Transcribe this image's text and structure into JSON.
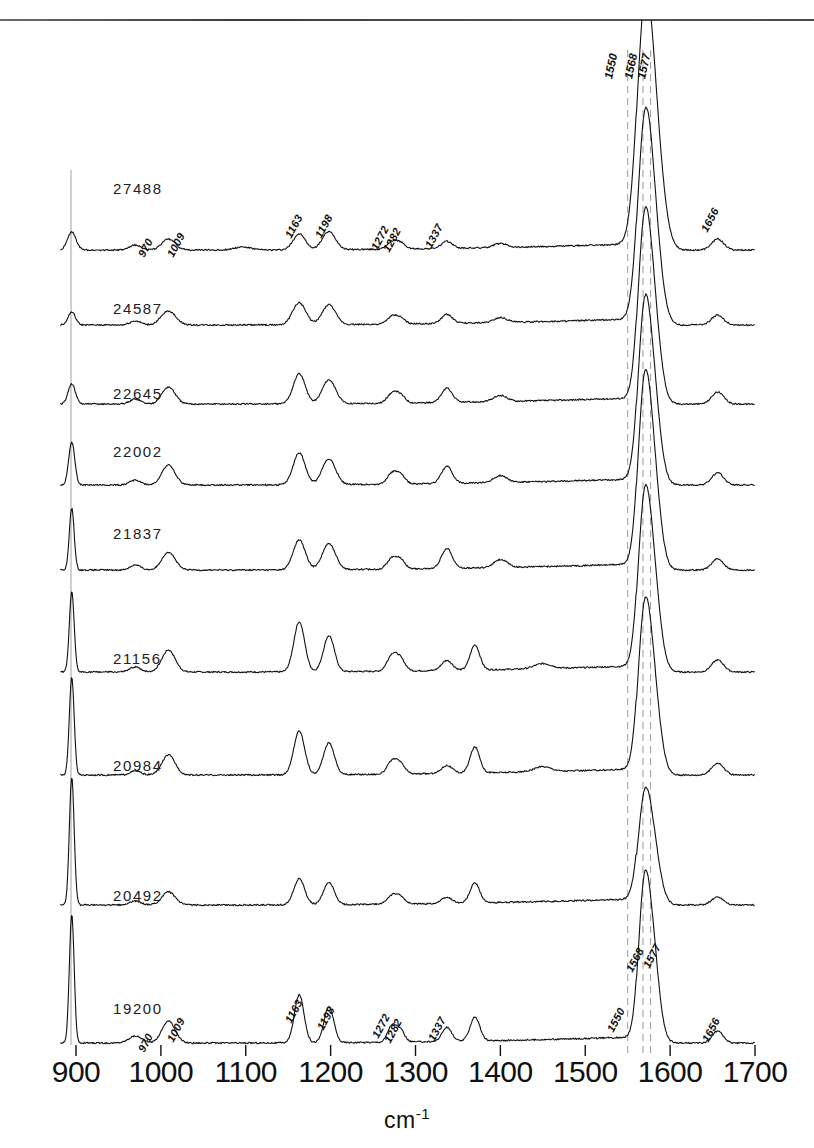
{
  "figure": {
    "ylabel": "Relative Intensity",
    "xlabel_text": "cm",
    "xlabel_sup": "-1"
  },
  "axis": {
    "ticks": [
      {
        "value": 900,
        "label": "900"
      },
      {
        "value": 1000,
        "label": "1000"
      },
      {
        "value": 1100,
        "label": "1100"
      },
      {
        "value": 1200,
        "label": "1200"
      },
      {
        "value": 1300,
        "label": "1300"
      },
      {
        "value": 1400,
        "label": "1400"
      },
      {
        "value": 1500,
        "label": "1500"
      },
      {
        "value": 1600,
        "label": "1600"
      },
      {
        "value": 1700,
        "label": "1700"
      }
    ]
  },
  "reference_lines": [
    {
      "value": 1550,
      "label": "1550"
    },
    {
      "value": 1568,
      "label": "1568"
    },
    {
      "value": 1577,
      "label": "1577"
    }
  ],
  "top_labels": [
    {
      "label": "1550"
    },
    {
      "label": "1568"
    },
    {
      "label": "1577"
    }
  ],
  "trace_labels": [
    {
      "label": "27488"
    },
    {
      "label": "24587"
    },
    {
      "label": "22645"
    },
    {
      "label": "22002"
    },
    {
      "label": "21837"
    },
    {
      "label": "21156"
    },
    {
      "label": "20984"
    },
    {
      "label": "20492"
    },
    {
      "label": "19200"
    }
  ],
  "peak_labels_top": [
    {
      "label": "970"
    },
    {
      "label": "1009"
    },
    {
      "label": "1163"
    },
    {
      "label": "1198"
    },
    {
      "label": "1272"
    },
    {
      "label": "1282"
    },
    {
      "label": "1337"
    },
    {
      "label": "1656"
    }
  ],
  "peak_labels_bottom": [
    {
      "label": "970"
    },
    {
      "label": "1009"
    },
    {
      "label": "1163"
    },
    {
      "label": "1198"
    },
    {
      "label": "1272"
    },
    {
      "label": "1282"
    },
    {
      "label": "1337"
    },
    {
      "label": "1550"
    },
    {
      "label": "1568"
    },
    {
      "label": "1577"
    },
    {
      "label": "1656"
    }
  ],
  "chart_data": {
    "type": "line",
    "title": "",
    "xlabel": "cm-1",
    "ylabel": "Relative Intensity",
    "xlim": [
      880,
      1700
    ],
    "grid": false,
    "legend": "none",
    "style": "stacked offset Raman spectra, 9 traces",
    "x_ticks": [
      900,
      1000,
      1100,
      1200,
      1300,
      1400,
      1500,
      1600,
      1700
    ],
    "reference_line_positions": [
      1550,
      1568,
      1577
    ],
    "annotated_peaks": [
      970,
      1009,
      1163,
      1198,
      1272,
      1282,
      1337,
      1550,
      1568,
      1577,
      1656
    ],
    "series": [
      {
        "name": "27488",
        "baseline_y": 250,
        "peaks": [
          {
            "x": 895,
            "h": 18,
            "w": 7
          },
          {
            "x": 970,
            "h": 5,
            "w": 9
          },
          {
            "x": 1009,
            "h": 11,
            "w": 11
          },
          {
            "x": 1096,
            "h": 3,
            "w": 14
          },
          {
            "x": 1163,
            "h": 16,
            "w": 10
          },
          {
            "x": 1198,
            "h": 18,
            "w": 11
          },
          {
            "x": 1272,
            "h": 7,
            "w": 8
          },
          {
            "x": 1282,
            "h": 6,
            "w": 8
          },
          {
            "x": 1337,
            "h": 7,
            "w": 9
          },
          {
            "x": 1400,
            "h": 4,
            "w": 11
          },
          {
            "x": 1577,
            "h": 168,
            "w": 16
          },
          {
            "x": 1568,
            "h": 120,
            "w": 12
          },
          {
            "x": 1656,
            "h": 11,
            "w": 10
          }
        ]
      },
      {
        "name": "24587",
        "baseline_y": 325,
        "peaks": [
          {
            "x": 895,
            "h": 13,
            "w": 6
          },
          {
            "x": 970,
            "h": 4,
            "w": 9
          },
          {
            "x": 1009,
            "h": 14,
            "w": 12
          },
          {
            "x": 1163,
            "h": 22,
            "w": 11
          },
          {
            "x": 1198,
            "h": 20,
            "w": 11
          },
          {
            "x": 1272,
            "h": 7,
            "w": 8
          },
          {
            "x": 1282,
            "h": 6,
            "w": 8
          },
          {
            "x": 1337,
            "h": 9,
            "w": 9
          },
          {
            "x": 1400,
            "h": 5,
            "w": 11
          },
          {
            "x": 1577,
            "h": 136,
            "w": 14
          },
          {
            "x": 1568,
            "h": 112,
            "w": 11
          },
          {
            "x": 1656,
            "h": 10,
            "w": 10
          }
        ]
      },
      {
        "name": "22645",
        "baseline_y": 404,
        "peaks": [
          {
            "x": 895,
            "h": 20,
            "w": 6
          },
          {
            "x": 970,
            "h": 5,
            "w": 9
          },
          {
            "x": 1009,
            "h": 17,
            "w": 11
          },
          {
            "x": 1163,
            "h": 30,
            "w": 10
          },
          {
            "x": 1198,
            "h": 24,
            "w": 11
          },
          {
            "x": 1272,
            "h": 9,
            "w": 8
          },
          {
            "x": 1282,
            "h": 8,
            "w": 8
          },
          {
            "x": 1337,
            "h": 14,
            "w": 9
          },
          {
            "x": 1400,
            "h": 6,
            "w": 11
          },
          {
            "x": 1577,
            "h": 122,
            "w": 13
          },
          {
            "x": 1568,
            "h": 108,
            "w": 10
          },
          {
            "x": 1656,
            "h": 12,
            "w": 10
          }
        ]
      },
      {
        "name": "22002",
        "baseline_y": 485,
        "peaks": [
          {
            "x": 895,
            "h": 43,
            "w": 5
          },
          {
            "x": 970,
            "h": 5,
            "w": 9
          },
          {
            "x": 1009,
            "h": 20,
            "w": 11
          },
          {
            "x": 1163,
            "h": 32,
            "w": 10
          },
          {
            "x": 1198,
            "h": 26,
            "w": 11
          },
          {
            "x": 1272,
            "h": 10,
            "w": 8
          },
          {
            "x": 1282,
            "h": 9,
            "w": 8
          },
          {
            "x": 1337,
            "h": 17,
            "w": 9
          },
          {
            "x": 1400,
            "h": 7,
            "w": 11
          },
          {
            "x": 1577,
            "h": 118,
            "w": 13
          },
          {
            "x": 1568,
            "h": 104,
            "w": 10
          },
          {
            "x": 1656,
            "h": 12,
            "w": 10
          }
        ]
      },
      {
        "name": "21837",
        "baseline_y": 570,
        "peaks": [
          {
            "x": 895,
            "h": 62,
            "w": 4
          },
          {
            "x": 970,
            "h": 5,
            "w": 9
          },
          {
            "x": 1009,
            "h": 18,
            "w": 11
          },
          {
            "x": 1163,
            "h": 30,
            "w": 10
          },
          {
            "x": 1198,
            "h": 26,
            "w": 11
          },
          {
            "x": 1272,
            "h": 10,
            "w": 8
          },
          {
            "x": 1282,
            "h": 9,
            "w": 8
          },
          {
            "x": 1337,
            "h": 20,
            "w": 9
          },
          {
            "x": 1400,
            "h": 8,
            "w": 11
          },
          {
            "x": 1577,
            "h": 124,
            "w": 13
          },
          {
            "x": 1568,
            "h": 110,
            "w": 10
          },
          {
            "x": 1656,
            "h": 11,
            "w": 10
          }
        ]
      },
      {
        "name": "21156",
        "baseline_y": 672,
        "peaks": [
          {
            "x": 895,
            "h": 80,
            "w": 4
          },
          {
            "x": 970,
            "h": 5,
            "w": 9
          },
          {
            "x": 1009,
            "h": 22,
            "w": 11
          },
          {
            "x": 1163,
            "h": 50,
            "w": 9
          },
          {
            "x": 1198,
            "h": 36,
            "w": 9
          },
          {
            "x": 1272,
            "h": 15,
            "w": 8
          },
          {
            "x": 1282,
            "h": 12,
            "w": 8
          },
          {
            "x": 1337,
            "h": 10,
            "w": 9
          },
          {
            "x": 1370,
            "h": 25,
            "w": 8
          },
          {
            "x": 1450,
            "h": 5,
            "w": 14
          },
          {
            "x": 1577,
            "h": 118,
            "w": 13
          },
          {
            "x": 1568,
            "h": 100,
            "w": 10
          },
          {
            "x": 1656,
            "h": 12,
            "w": 10
          }
        ]
      },
      {
        "name": "20984",
        "baseline_y": 775,
        "peaks": [
          {
            "x": 895,
            "h": 98,
            "w": 4
          },
          {
            "x": 970,
            "h": 4,
            "w": 9
          },
          {
            "x": 1009,
            "h": 20,
            "w": 11
          },
          {
            "x": 1163,
            "h": 44,
            "w": 9
          },
          {
            "x": 1198,
            "h": 32,
            "w": 9
          },
          {
            "x": 1272,
            "h": 12,
            "w": 8
          },
          {
            "x": 1282,
            "h": 10,
            "w": 8
          },
          {
            "x": 1337,
            "h": 8,
            "w": 9
          },
          {
            "x": 1370,
            "h": 26,
            "w": 8
          },
          {
            "x": 1450,
            "h": 5,
            "w": 14
          },
          {
            "x": 1577,
            "h": 112,
            "w": 13
          },
          {
            "x": 1568,
            "h": 96,
            "w": 10
          },
          {
            "x": 1656,
            "h": 12,
            "w": 10
          }
        ]
      },
      {
        "name": "20492",
        "baseline_y": 905,
        "peaks": [
          {
            "x": 895,
            "h": 128,
            "w": 4
          },
          {
            "x": 970,
            "h": 4,
            "w": 9
          },
          {
            "x": 1009,
            "h": 13,
            "w": 11
          },
          {
            "x": 1163,
            "h": 26,
            "w": 9
          },
          {
            "x": 1198,
            "h": 22,
            "w": 9
          },
          {
            "x": 1272,
            "h": 8,
            "w": 8
          },
          {
            "x": 1282,
            "h": 7,
            "w": 8
          },
          {
            "x": 1337,
            "h": 6,
            "w": 9
          },
          {
            "x": 1370,
            "h": 20,
            "w": 8
          },
          {
            "x": 1577,
            "h": 75,
            "w": 13
          },
          {
            "x": 1568,
            "h": 62,
            "w": 10
          },
          {
            "x": 1656,
            "h": 8,
            "w": 10
          }
        ]
      },
      {
        "name": "19200",
        "baseline_y": 1043,
        "peaks": [
          {
            "x": 895,
            "h": 128,
            "w": 4
          },
          {
            "x": 970,
            "h": 7,
            "w": 11
          },
          {
            "x": 1009,
            "h": 22,
            "w": 11
          },
          {
            "x": 1163,
            "h": 48,
            "w": 8
          },
          {
            "x": 1198,
            "h": 36,
            "w": 8
          },
          {
            "x": 1272,
            "h": 16,
            "w": 7
          },
          {
            "x": 1282,
            "h": 12,
            "w": 7
          },
          {
            "x": 1337,
            "h": 14,
            "w": 8
          },
          {
            "x": 1370,
            "h": 24,
            "w": 8
          },
          {
            "x": 1577,
            "h": 112,
            "w": 12
          },
          {
            "x": 1568,
            "h": 96,
            "w": 9
          },
          {
            "x": 1656,
            "h": 12,
            "w": 9
          }
        ]
      }
    ]
  }
}
